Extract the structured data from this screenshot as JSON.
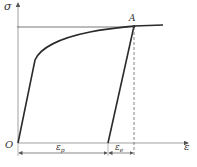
{
  "diagram": {
    "type": "stress-strain-loading-unloading",
    "axes": {
      "y_label": "σ",
      "x_label": "ε",
      "origin_label": "O"
    },
    "point_label": "A",
    "dimensions": {
      "plastic_strain": "εp",
      "plastic_strain_base": "ε",
      "plastic_strain_sub": "p",
      "elastic_strain_base": "ε",
      "elastic_strain_sub": "e"
    },
    "colors": {
      "line": "#2a2a2a",
      "dashed": "#666666",
      "text": "#333333"
    }
  }
}
